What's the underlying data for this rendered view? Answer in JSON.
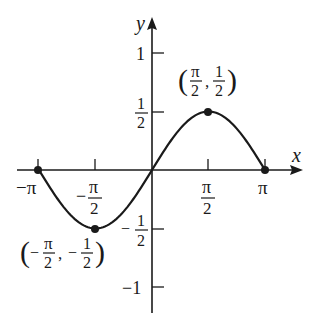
{
  "chart_data": {
    "type": "line",
    "title": "",
    "function": "y = (1/2) sin x",
    "xlabel": "x",
    "ylabel": "y",
    "xlim": [
      -3.14159,
      3.14159
    ],
    "ylim": [
      -1,
      1
    ],
    "grid": false,
    "legend": null,
    "x_ticks": [
      {
        "value": -3.14159,
        "label": "−π"
      },
      {
        "value": -1.5708,
        "label": "−π/2"
      },
      {
        "value": 1.5708,
        "label": "π/2"
      },
      {
        "value": 3.14159,
        "label": "π"
      }
    ],
    "y_ticks": [
      {
        "value": 1,
        "label": "1"
      },
      {
        "value": 0.5,
        "label": "1/2"
      },
      {
        "value": -0.5,
        "label": "−1/2"
      },
      {
        "value": -1,
        "label": "−1"
      }
    ],
    "series": [
      {
        "name": "y = ½ sin x",
        "x": [
          -3.14159,
          -2.35619,
          -1.5708,
          -0.7854,
          0,
          0.7854,
          1.5708,
          2.35619,
          3.14159
        ],
        "y": [
          0,
          -0.3536,
          -0.5,
          -0.3536,
          0,
          0.3536,
          0.5,
          0.3536,
          0
        ]
      }
    ],
    "marked_points": [
      {
        "x": -3.14159,
        "y": 0
      },
      {
        "x": -1.5708,
        "y": -0.5,
        "label": "(−π/2, −1/2)"
      },
      {
        "x": 1.5708,
        "y": 0.5,
        "label": "(π/2, 1/2)"
      },
      {
        "x": 3.14159,
        "y": 0
      }
    ],
    "annotations": [
      {
        "text": "(π/2, 1/2)",
        "at": [
          1.5708,
          0.5
        ]
      },
      {
        "text": "(−π/2, −1/2)",
        "at": [
          -1.5708,
          -0.5
        ]
      }
    ]
  },
  "labels": {
    "x_axis": "x",
    "y_axis": "y",
    "neg_pi": "−π",
    "pi": "π",
    "pi_sym": "π",
    "minus": "−",
    "two": "2",
    "one": "1",
    "neg_one": "−1",
    "max_point": {
      "open": "(",
      "sep": ",",
      "close": ")"
    },
    "min_point": {
      "open": "(",
      "sep": ",",
      "close": ")"
    }
  },
  "colors": {
    "curve": "#1a1a1a",
    "axis": "#1a1a1a",
    "background": "#ffffff"
  }
}
